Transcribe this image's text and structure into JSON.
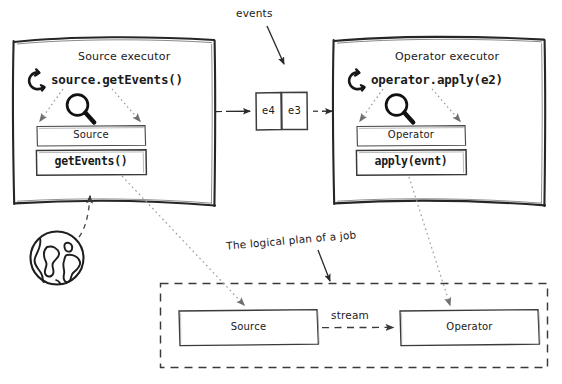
{
  "diagram": {
    "title_note": "events",
    "logical_plan_note": "The logical plan of a job",
    "stream_label": "stream"
  },
  "source_executor": {
    "title": "Source executor",
    "call": "source.getEvents()",
    "loop_icon": "loop-arrow-icon",
    "magnifier_icon": "magnifier-icon",
    "inner_box_label": "Source",
    "inner_method_label": "getEvents()"
  },
  "operator_executor": {
    "title": "Operator executor",
    "call": "operator.apply(e2)",
    "loop_icon": "loop-arrow-icon",
    "magnifier_icon": "magnifier-icon",
    "inner_box_label": "Operator",
    "inner_method_label": "apply(evnt)"
  },
  "events_queue": {
    "cells": [
      "e4",
      "e3"
    ]
  },
  "logical_plan": {
    "source_label": "Source",
    "operator_label": "Operator",
    "edge_label": "stream"
  },
  "world": {
    "icon": "globe-icon"
  },
  "colors": {
    "ink": "#1a1a1a",
    "line": "#2b2b2b",
    "dotted": "#9a9a9a",
    "dashed": "#444444",
    "background": "#ffffff"
  }
}
